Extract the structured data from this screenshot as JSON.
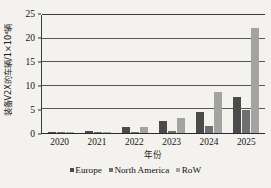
{
  "chart_data": {
    "type": "bar",
    "title": "",
    "subtitle": "",
    "xlabel": "年份",
    "ylabel": "装备V2X的车辆/1×10⁴辆",
    "categories": [
      "2020",
      "2021",
      "2022",
      "2023",
      "2024",
      "2025"
    ],
    "series": [
      {
        "name": "Europe",
        "color": "#4b4b4b",
        "values": [
          0.15,
          0.5,
          1.2,
          2.5,
          4.4,
          7.6
        ]
      },
      {
        "name": "North America",
        "color": "#6f6f6f",
        "values": [
          0.1,
          0.15,
          0.25,
          0.35,
          1.5,
          4.9
        ]
      },
      {
        "name": "RoW",
        "color": "#a3a3a3",
        "values": [
          0.1,
          0.25,
          1.2,
          3.2,
          8.6,
          22.0
        ]
      }
    ],
    "ylim": [
      0,
      25
    ],
    "yticks": [
      0,
      5,
      10,
      15,
      20,
      25
    ],
    "ytick_labels": [
      "0",
      "5",
      "10",
      "15",
      "20",
      "25"
    ],
    "grid": true,
    "grid_axis": "y",
    "legend_position": "bottom",
    "legend_entries": [
      "Europe",
      "North America",
      "RoW"
    ],
    "annotations": [],
    "background_color": "#f4f2ef",
    "axis_color": "#2a2a2a"
  }
}
